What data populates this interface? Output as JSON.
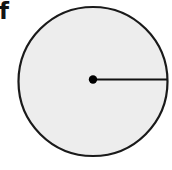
{
  "figure": {
    "part_label": "f",
    "canvas": {
      "width": 172,
      "height": 170
    },
    "background_color": "#ffffff"
  },
  "colors": {
    "background": "#ffffff",
    "circle_fill": "#ededed",
    "circle_stroke": "#1a1a1a",
    "radius_line": "#111111",
    "centre_dot": "#000000",
    "label_text": "#141414"
  },
  "chart_data": {
    "type": "diagram",
    "title": "",
    "xlabel": "",
    "ylabel": "",
    "shapes": [
      {
        "name": "circle",
        "kind": "circle",
        "cx": 93,
        "cy": 81.5,
        "r": 74.5,
        "fill": "#ededed",
        "stroke": "#1a1a1a",
        "stroke_width": 2.2
      },
      {
        "name": "radius-segment",
        "kind": "line",
        "x1": 93,
        "y1": 79.5,
        "x2": 167,
        "y2": 79.5,
        "stroke": "#111111",
        "stroke_width": 2.2
      },
      {
        "name": "centre-point",
        "kind": "dot",
        "cx": 93,
        "cy": 79.5,
        "r": 4.2,
        "fill": "#000000"
      }
    ],
    "annotations": [
      {
        "name": "part-label",
        "text": "f",
        "x": 0,
        "y": 3
      }
    ]
  }
}
